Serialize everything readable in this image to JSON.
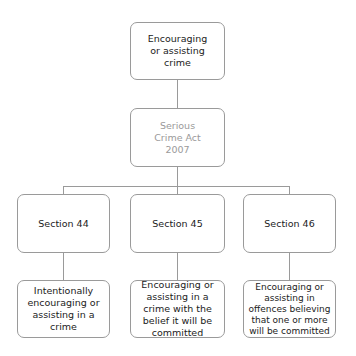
{
  "diagram": {
    "type": "hierarchy",
    "root": {
      "label": "Encouraging or assisting crime"
    },
    "act": {
      "label": "Serious Crime Act 2007"
    },
    "sections": [
      {
        "label": "Section 44",
        "description": "Intentionally encouraging or assisting in a crime"
      },
      {
        "label": "Section 45",
        "description": "Encouraging or assisting in a crime with the belief it will be committed"
      },
      {
        "label": "Section 46",
        "description": "Encouraging or assisting in offences believing that one or more will be committed"
      }
    ],
    "colors": {
      "border": "#9a9a9a",
      "text": "#222222",
      "muted_text": "#9a9a9a"
    }
  }
}
